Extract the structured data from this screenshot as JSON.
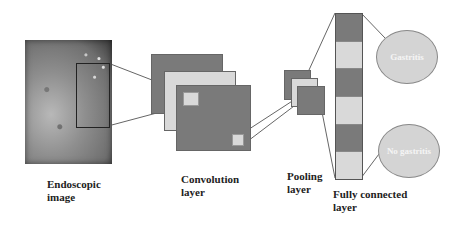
{
  "diagram": {
    "stages": [
      {
        "id": "input",
        "label_line1": "Endoscopic",
        "label_line2": "image"
      },
      {
        "id": "conv",
        "label_line1": "Convolution",
        "label_line2": "layer"
      },
      {
        "id": "pool",
        "label_line1": "Pooling",
        "label_line2": "layer"
      },
      {
        "id": "fc",
        "label_line1": "Fully connected",
        "label_line2": "layer"
      }
    ],
    "outputs": [
      {
        "label": "Gastritis"
      },
      {
        "label": "No gastritis"
      }
    ],
    "fc_cells": [
      "dark",
      "light",
      "dark",
      "light",
      "dark",
      "light"
    ],
    "colors": {
      "dark_block": "#7a7a7a",
      "light_block": "#d9d9d9",
      "oval_fill": "#d4d4d4",
      "lines": "#555555"
    }
  }
}
